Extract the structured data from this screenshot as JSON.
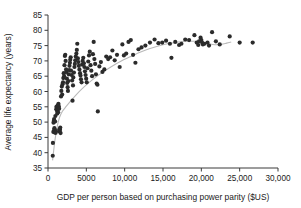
{
  "chart_data": {
    "type": "scatter",
    "title": "",
    "xlabel": "GDP per person based on purchasing power parity ($US)",
    "ylabel": "Average life expectancy (years)",
    "xlim": [
      0,
      30000
    ],
    "ylim": [
      35,
      85
    ],
    "grid": false,
    "legend": null,
    "xticks": [
      0,
      5000,
      10000,
      15000,
      20000,
      25000,
      30000
    ],
    "xtick_labels": [
      "0",
      "5000",
      "10,000",
      "15,000",
      "20,000",
      "25,000",
      "30,000"
    ],
    "yticks": [
      35,
      40,
      45,
      50,
      55,
      60,
      65,
      70,
      75,
      80,
      85
    ],
    "ytick_labels": [
      "35",
      "40",
      "45",
      "50",
      "55",
      "60",
      "65",
      "70",
      "75",
      "80",
      "85"
    ],
    "marker": {
      "shape": "circle",
      "color": "#2b2b2b",
      "size": 2.1
    },
    "trend_line": {
      "type": "smoothed-lowess",
      "color": "#b9b9b9",
      "points": [
        [
          600,
          37.5
        ],
        [
          900,
          44.0
        ],
        [
          1200,
          48.5
        ],
        [
          1500,
          51.5
        ],
        [
          1900,
          53.6
        ],
        [
          2400,
          55.2
        ],
        [
          3000,
          57.0
        ],
        [
          3700,
          59.0
        ],
        [
          4500,
          61.0
        ],
        [
          5300,
          62.8
        ],
        [
          6200,
          64.6
        ],
        [
          7200,
          66.4
        ],
        [
          8300,
          68.2
        ],
        [
          9500,
          69.9
        ],
        [
          10800,
          71.4
        ],
        [
          12000,
          72.8
        ],
        [
          13200,
          74.0
        ],
        [
          14400,
          74.9
        ],
        [
          15600,
          75.6
        ],
        [
          16800,
          76.1
        ],
        [
          18000,
          76.4
        ],
        [
          19200,
          76.4
        ],
        [
          20200,
          76.1
        ],
        [
          21000,
          75.6
        ],
        [
          21800,
          75.3
        ],
        [
          22600,
          75.4
        ],
        [
          23300,
          75.8
        ],
        [
          23900,
          76.2
        ]
      ]
    },
    "points": [
      [
        620,
        39.0
      ],
      [
        640,
        43.2
      ],
      [
        700,
        46.8
      ],
      [
        720,
        49.8
      ],
      [
        760,
        50.4
      ],
      [
        780,
        47.2
      ],
      [
        800,
        51.0
      ],
      [
        830,
        48.0
      ],
      [
        860,
        46.6
      ],
      [
        900,
        47.4
      ],
      [
        930,
        50.2
      ],
      [
        960,
        52.0
      ],
      [
        1000,
        46.5
      ],
      [
        1040,
        47.0
      ],
      [
        1080,
        54.2
      ],
      [
        1100,
        55.0
      ],
      [
        1150,
        54.6
      ],
      [
        1180,
        53.6
      ],
      [
        1210,
        52.8
      ],
      [
        1250,
        55.4
      ],
      [
        1280,
        54.0
      ],
      [
        1320,
        53.2
      ],
      [
        1360,
        56.0
      ],
      [
        1400,
        55.2
      ],
      [
        1450,
        54.4
      ],
      [
        1480,
        47.6
      ],
      [
        1520,
        46.9
      ],
      [
        1560,
        47.5
      ],
      [
        1600,
        48.2
      ],
      [
        1640,
        46.4
      ],
      [
        1700,
        58.4
      ],
      [
        1740,
        60.2
      ],
      [
        1800,
        61.6
      ],
      [
        1850,
        59.0
      ],
      [
        1900,
        62.4
      ],
      [
        1960,
        63.0
      ],
      [
        2000,
        64.4
      ],
      [
        2050,
        66.0
      ],
      [
        2100,
        65.0
      ],
      [
        2150,
        68.6
      ],
      [
        2200,
        71.6
      ],
      [
        2250,
        72.0
      ],
      [
        2300,
        70.0
      ],
      [
        2360,
        67.2
      ],
      [
        2400,
        66.4
      ],
      [
        2460,
        64.2
      ],
      [
        2500,
        62.8
      ],
      [
        2560,
        61.4
      ],
      [
        2600,
        60.2
      ],
      [
        2660,
        63.4
      ],
      [
        2700,
        65.6
      ],
      [
        2760,
        67.0
      ],
      [
        2800,
        68.4
      ],
      [
        2860,
        69.4
      ],
      [
        2900,
        70.4
      ],
      [
        2960,
        71.2
      ],
      [
        3000,
        66.8
      ],
      [
        3080,
        65.4
      ],
      [
        3150,
        63.6
      ],
      [
        3200,
        57.0
      ],
      [
        3260,
        62.0
      ],
      [
        3300,
        64.6
      ],
      [
        3380,
        66.2
      ],
      [
        3450,
        68.0
      ],
      [
        3500,
        69.0
      ],
      [
        3560,
        70.2
      ],
      [
        3620,
        71.4
      ],
      [
        3700,
        72.4
      ],
      [
        3760,
        73.6
      ],
      [
        3820,
        75.6
      ],
      [
        3900,
        70.8
      ],
      [
        3960,
        69.6
      ],
      [
        4020,
        68.4
      ],
      [
        4100,
        67.2
      ],
      [
        4180,
        66.0
      ],
      [
        4240,
        65.2
      ],
      [
        4300,
        64.0
      ],
      [
        4380,
        63.0
      ],
      [
        4450,
        68.8
      ],
      [
        4520,
        70.0
      ],
      [
        4600,
        71.0
      ],
      [
        4680,
        69.2
      ],
      [
        4750,
        68.0
      ],
      [
        4820,
        66.6
      ],
      [
        4900,
        65.4
      ],
      [
        4980,
        64.2
      ],
      [
        5050,
        63.0
      ],
      [
        5150,
        67.6
      ],
      [
        5250,
        69.8
      ],
      [
        5350,
        71.8
      ],
      [
        5450,
        73.0
      ],
      [
        5550,
        68.6
      ],
      [
        5650,
        66.8
      ],
      [
        5750,
        65.0
      ],
      [
        5860,
        72.2
      ],
      [
        5960,
        76.2
      ],
      [
        6050,
        70.6
      ],
      [
        6150,
        69.0
      ],
      [
        6250,
        65.6
      ],
      [
        6350,
        62.6
      ],
      [
        6450,
        62.2
      ],
      [
        6500,
        53.5
      ],
      [
        6700,
        68.2
      ],
      [
        6900,
        69.6
      ],
      [
        7100,
        66.4
      ],
      [
        7350,
        67.2
      ],
      [
        7600,
        71.4
      ],
      [
        7850,
        70.6
      ],
      [
        8100,
        71.2
      ],
      [
        8400,
        73.4
      ],
      [
        8700,
        70.2
      ],
      [
        9000,
        72.0
      ],
      [
        9350,
        68.0
      ],
      [
        9700,
        75.4
      ],
      [
        9900,
        71.8
      ],
      [
        10200,
        72.4
      ],
      [
        10500,
        76.2
      ],
      [
        10800,
        76.8
      ],
      [
        11100,
        72.0
      ],
      [
        11400,
        69.4
      ],
      [
        11800,
        73.8
      ],
      [
        12200,
        74.4
      ],
      [
        12700,
        75.0
      ],
      [
        13300,
        76.0
      ],
      [
        13900,
        77.0
      ],
      [
        14400,
        75.8
      ],
      [
        14900,
        76.0
      ],
      [
        15400,
        76.6
      ],
      [
        15900,
        75.6
      ],
      [
        16100,
        71.0
      ],
      [
        16600,
        76.2
      ],
      [
        17100,
        75.2
      ],
      [
        17400,
        75.6
      ],
      [
        17900,
        77.0
      ],
      [
        18400,
        76.8
      ],
      [
        19100,
        78.4
      ],
      [
        19400,
        76.0
      ],
      [
        19600,
        75.2
      ],
      [
        19700,
        76.4
      ],
      [
        19900,
        77.6
      ],
      [
        20000,
        76.8
      ],
      [
        20100,
        76.0
      ],
      [
        20200,
        75.4
      ],
      [
        20400,
        75.6
      ],
      [
        20800,
        76.0
      ],
      [
        21000,
        75.0
      ],
      [
        21400,
        79.4
      ],
      [
        21900,
        76.4
      ],
      [
        22400,
        75.4
      ],
      [
        23700,
        78.0
      ],
      [
        25000,
        76.0
      ],
      [
        26700,
        76.0
      ]
    ]
  }
}
